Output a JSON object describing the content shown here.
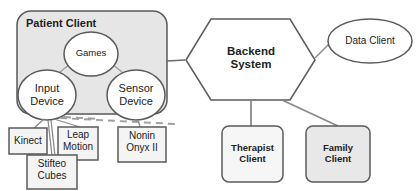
{
  "diagram": {
    "type": "system-architecture",
    "colors": {
      "stroke": "#5a5a5a",
      "container_fill": "#e6e6e6",
      "box_fill": "#f4f4f4",
      "node_fill": "#ffffff",
      "connector": "#9a9a9a"
    },
    "nodes": {
      "patient_client": {
        "label": "Patient Client",
        "shape": "rounded-rect"
      },
      "games": {
        "label": "Games",
        "shape": "ellipse"
      },
      "input_device": {
        "label": "Input\nDevice",
        "shape": "ellipse"
      },
      "sensor_device": {
        "label": "Sensor\nDevice",
        "shape": "ellipse"
      },
      "kinect": {
        "label": "Kinect",
        "shape": "rect"
      },
      "leap_motion": {
        "label": "Leap\nMotion",
        "shape": "rect"
      },
      "stifteo_cubes": {
        "label": "Stifteo\nCubes",
        "shape": "rect"
      },
      "nonin_onyx": {
        "label": "Nonin\nOnyx II",
        "shape": "rect"
      },
      "backend_system": {
        "label": "Backend\nSystem",
        "shape": "hexagon"
      },
      "data_client": {
        "label": "Data Client",
        "shape": "ellipse"
      },
      "therapist_client": {
        "label": "Therapist\nClient",
        "shape": "rounded-rect"
      },
      "family_client": {
        "label": "Family\nClient",
        "shape": "rounded-rect"
      }
    },
    "edges": [
      {
        "from": "games",
        "to": "input_device",
        "style": "solid"
      },
      {
        "from": "games",
        "to": "sensor_device",
        "style": "solid"
      },
      {
        "from": "input_device",
        "to": "kinect",
        "style": "solid"
      },
      {
        "from": "input_device",
        "to": "stifteo_cubes",
        "style": "solid"
      },
      {
        "from": "input_device",
        "to": "leap_motion",
        "style": "solid"
      },
      {
        "from": "sensor_device",
        "to": "nonin_onyx",
        "style": "solid"
      },
      {
        "from": "patient_client",
        "to": "backend_system",
        "style": "solid"
      },
      {
        "from": "backend_system",
        "to": "data_client",
        "style": "solid"
      },
      {
        "from": "backend_system",
        "to": "therapist_client",
        "style": "solid"
      },
      {
        "from": "backend_system",
        "to": "family_client",
        "style": "solid"
      },
      {
        "from": "input_device",
        "to": "offscreen-right",
        "style": "dashed"
      }
    ]
  }
}
